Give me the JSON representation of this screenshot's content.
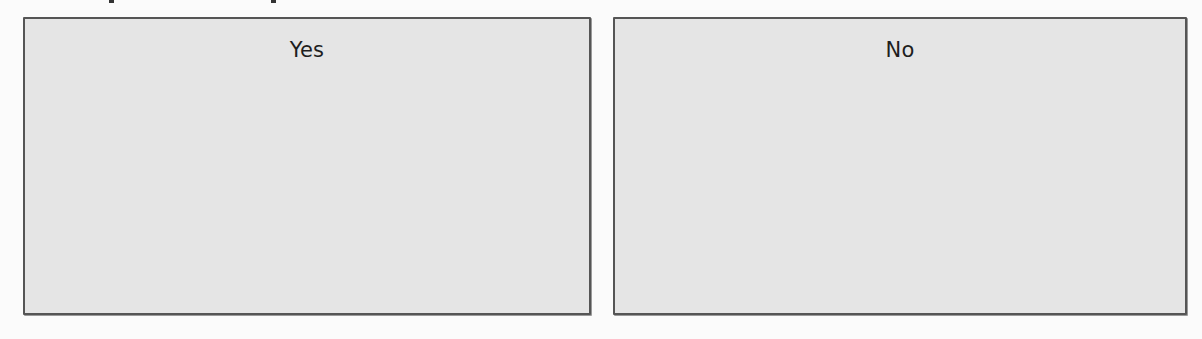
{
  "choices": [
    {
      "id": "yes",
      "label": "Yes"
    },
    {
      "id": "no",
      "label": "No"
    }
  ],
  "colors": {
    "card_background": "#e5e5e5",
    "card_border": "#555555",
    "page_background": "#fbfbfb",
    "label_text": "#1e1e1e"
  }
}
